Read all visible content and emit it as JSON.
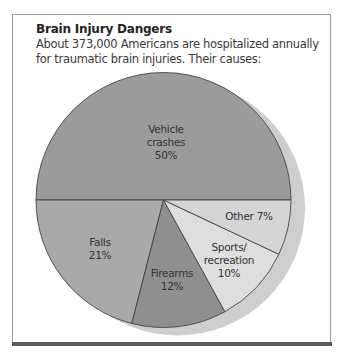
{
  "header": {
    "title": "Brain Injury Dangers",
    "subtitle": "About 373,000 Americans are hospitalized annually for traumatic brain injuries. Their causes:"
  },
  "colors": {
    "vehicle": "#9b9b9b",
    "falls": "#a9a9a9",
    "firearms": "#8f8f8f",
    "sports": "#dedede",
    "other": "#d5d5d5",
    "shadow": "#cecece",
    "stroke": "#444444",
    "rule": "#5a5a5a"
  },
  "labels": {
    "vehicle": [
      "Vehicle",
      "crashes",
      "50%"
    ],
    "falls": [
      "Falls",
      "21%"
    ],
    "firearms": [
      "Firearms",
      "12%"
    ],
    "sports": [
      "Sports/",
      "recreation",
      "10%"
    ],
    "other": [
      "Other 7%"
    ]
  },
  "chart_data": {
    "type": "pie",
    "title": "Brain Injury Dangers",
    "subtitle": "About 373,000 Americans are hospitalized annually for traumatic brain injuries. Their causes:",
    "categories": [
      "Vehicle crashes",
      "Falls",
      "Firearms",
      "Sports/recreation",
      "Other"
    ],
    "values": [
      50,
      21,
      12,
      10,
      7
    ],
    "unit": "%",
    "legend": "none (labels inside slices)"
  }
}
